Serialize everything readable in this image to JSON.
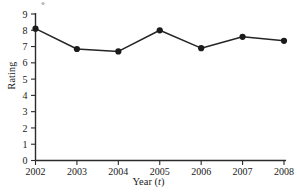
{
  "chart_data": {
    "type": "line",
    "title": "",
    "subtitle": "",
    "xlabel": "Year (t)",
    "xlabel_plain": "Year",
    "xlabel_variable": "t",
    "ylabel": "Rating",
    "categories": [
      2002,
      2003,
      2004,
      2005,
      2006,
      2007,
      2008
    ],
    "x": [
      2002,
      2003,
      2004,
      2005,
      2006,
      2007,
      2008
    ],
    "values": [
      8.1,
      6.85,
      6.7,
      8.0,
      6.9,
      7.6,
      7.35
    ],
    "series": [
      {
        "name": "Rating",
        "values": [
          8.1,
          6.85,
          6.7,
          8.0,
          6.9,
          7.6,
          7.35
        ],
        "marker": "filled-circle",
        "color": "#1b1b1b"
      }
    ],
    "xtick_labels": [
      "2002",
      "2003",
      "2004",
      "2005",
      "2006",
      "2007",
      "2008"
    ],
    "ytick_labels": [
      "0",
      "1",
      "2",
      "3",
      "4",
      "5",
      "6",
      "7",
      "8",
      "9"
    ],
    "ytick_values": [
      0,
      1,
      2,
      3,
      4,
      5,
      6,
      7,
      8,
      9
    ],
    "ylim": [
      0,
      9
    ],
    "xlim": [
      2002,
      2008
    ],
    "grid": false,
    "legend": false,
    "legend_position": "none",
    "line_color": "#252525",
    "marker_color": "#1b1b1b",
    "axis_color": "#2b2b2b",
    "background": "#ffffff"
  }
}
